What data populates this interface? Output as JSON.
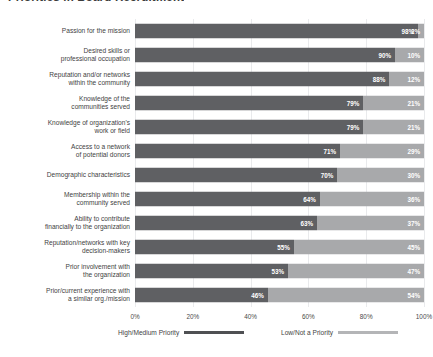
{
  "title": "Priorities in Board Recruitment",
  "chart_data": {
    "type": "bar",
    "subtype": "stacked-horizontal-100",
    "title": "Priorities in Board Recruitment",
    "xlabel": "",
    "ylabel": "",
    "xlim": [
      0,
      100
    ],
    "grid": true,
    "legend_position": "bottom",
    "xticks": [
      "0%",
      "20%",
      "40%",
      "60%",
      "80%",
      "100%"
    ],
    "xtick_values": [
      0,
      20,
      40,
      60,
      80,
      100
    ],
    "categories": [
      "Passion for the mission",
      "Desired skills or professional occupation",
      "Reputation and/or networks within the community",
      "Knowledge of the communities served",
      "Knowledge of organization's work or field",
      "Access to a network of potential donors",
      "Demographic characteristics",
      "Membership within the community served",
      "Ability to contribute financially to the organization",
      "Reputation/networks with key decision-makers",
      "Prior involvement with the organization",
      "Prior/current experience with a similar org./mission"
    ],
    "series": [
      {
        "name": "High/Medium Priority",
        "color": "#5f6063",
        "values": [
          98,
          90,
          88,
          79,
          79,
          71,
          70,
          64,
          63,
          55,
          53,
          46
        ]
      },
      {
        "name": "Low/Not a Priority",
        "color": "#a8a9ab",
        "values": [
          2,
          10,
          12,
          21,
          21,
          29,
          30,
          36,
          37,
          45,
          47,
          54
        ]
      }
    ],
    "rows": [
      {
        "label_line1": "Passion for the mission",
        "label_line2": "",
        "high": 98,
        "low": 2,
        "high_label": "98%",
        "low_label": "2%"
      },
      {
        "label_line1": "Desired skills or",
        "label_line2": "professional occupation",
        "high": 90,
        "low": 10,
        "high_label": "90%",
        "low_label": "10%"
      },
      {
        "label_line1": "Reputation and/or networks",
        "label_line2": "within the community",
        "high": 88,
        "low": 12,
        "high_label": "88%",
        "low_label": "12%"
      },
      {
        "label_line1": "Knowledge of the",
        "label_line2": "communities served",
        "high": 79,
        "low": 21,
        "high_label": "79%",
        "low_label": "21%"
      },
      {
        "label_line1": "Knowledge of organization's",
        "label_line2": "work or field",
        "high": 79,
        "low": 21,
        "high_label": "79%",
        "low_label": "21%"
      },
      {
        "label_line1": "Access to a network",
        "label_line2": "of potential donors",
        "high": 71,
        "low": 29,
        "high_label": "71%",
        "low_label": "29%"
      },
      {
        "label_line1": "Demographic characteristics",
        "label_line2": "",
        "high": 70,
        "low": 30,
        "high_label": "70%",
        "low_label": "30%"
      },
      {
        "label_line1": "Membership within the",
        "label_line2": "community served",
        "high": 64,
        "low": 36,
        "high_label": "64%",
        "low_label": "36%"
      },
      {
        "label_line1": "Ability to contribute",
        "label_line2": "financially to the organization",
        "high": 63,
        "low": 37,
        "high_label": "63%",
        "low_label": "37%"
      },
      {
        "label_line1": "Reputation/networks with key",
        "label_line2": "decision-makers",
        "high": 55,
        "low": 45,
        "high_label": "55%",
        "low_label": "45%"
      },
      {
        "label_line1": "Prior involvement with",
        "label_line2": "the organization",
        "high": 53,
        "low": 47,
        "high_label": "53%",
        "low_label": "47%"
      },
      {
        "label_line1": "Prior/current experience with",
        "label_line2": "a similar org./mission",
        "high": 46,
        "low": 54,
        "high_label": "46%",
        "low_label": "54%"
      }
    ],
    "legend": [
      {
        "label": "High/Medium Priority",
        "color": "#4f5053"
      },
      {
        "label": "Low/Not a Priority",
        "color": "#b4b5b7"
      }
    ]
  },
  "colors": {
    "high": "#5f6063",
    "low": "#a8a9ab",
    "grid": "#e9eaec",
    "text": "#3f3f3f",
    "background": "#ffffff"
  }
}
